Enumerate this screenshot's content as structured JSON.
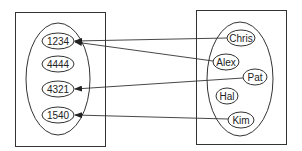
{
  "diagram": {
    "type": "mapping",
    "codomain": {
      "name": "numbers",
      "elements": [
        {
          "id": "n1234",
          "label": "1234",
          "cx": 58,
          "cy": 41
        },
        {
          "id": "n4444",
          "label": "4444",
          "cx": 58,
          "cy": 64
        },
        {
          "id": "n4321",
          "label": "4321",
          "cx": 58,
          "cy": 89
        },
        {
          "id": "n1540",
          "label": "1540",
          "cx": 58,
          "cy": 115
        }
      ]
    },
    "domain": {
      "name": "names",
      "elements": [
        {
          "id": "chris",
          "label": "Chris",
          "cx": 241,
          "cy": 38
        },
        {
          "id": "alex",
          "label": "Alex",
          "cx": 226,
          "cy": 62
        },
        {
          "id": "pat",
          "label": "Pat",
          "cx": 254,
          "cy": 77
        },
        {
          "id": "hal",
          "label": "Hal",
          "cx": 227,
          "cy": 96
        },
        {
          "id": "kim",
          "label": "Kim",
          "cx": 240,
          "cy": 120
        }
      ]
    },
    "mappings": [
      {
        "from": "Chris",
        "to": "1234"
      },
      {
        "from": "Alex",
        "to": "1234"
      },
      {
        "from": "Pat",
        "to": "4321"
      },
      {
        "from": "Kim",
        "to": "1540"
      }
    ],
    "colors": {
      "stroke": "#333333",
      "text": "#222222",
      "background": "#ffffff"
    }
  }
}
